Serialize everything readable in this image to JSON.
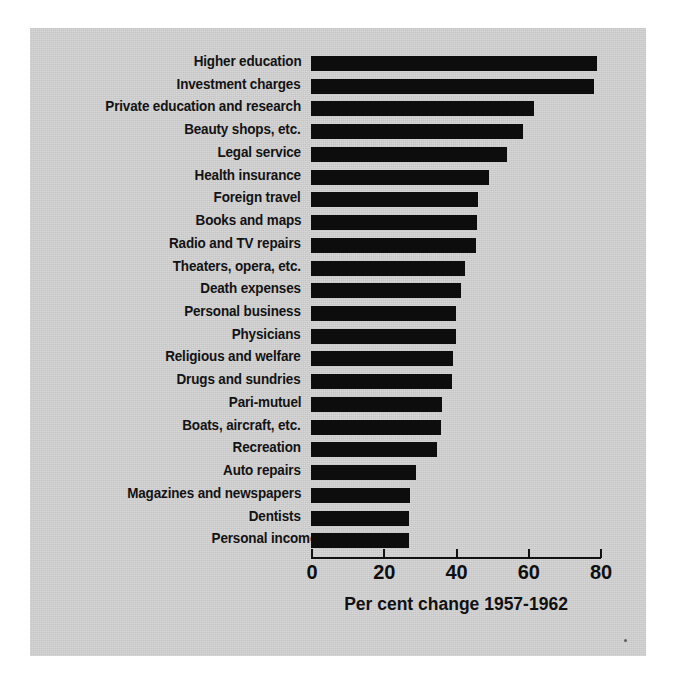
{
  "chart_data": {
    "type": "bar",
    "orientation": "horizontal",
    "title": "",
    "xlabel": "Per cent change 1957-1962",
    "ylabel": "",
    "xlim": [
      0,
      80
    ],
    "xticks": [
      0,
      20,
      40,
      60,
      80
    ],
    "xtick_labels": [
      "0",
      "20",
      "40",
      "60",
      "80"
    ],
    "grid": false,
    "legend": null,
    "bar_color": "#0d0d0d",
    "background_color": "#d2d3d2",
    "categories": [
      "Higher education",
      "Investment charges",
      "Private education and research",
      "Beauty shops, etc.",
      "Legal service",
      "Health insurance",
      "Foreign travel",
      "Books and maps",
      "Radio and TV repairs",
      "Theaters, opera, etc.",
      "Death expenses",
      "Personal business",
      "Physicians",
      "Religious and welfare",
      "Drugs and sundries",
      "Pari-mutuel",
      "Boats, aircraft, etc.",
      "Recreation",
      "Auto repairs",
      "Magazines and newspapers",
      "Dentists",
      "Personal income"
    ],
    "values": [
      79.3,
      78.4,
      61.8,
      58.6,
      54.2,
      49.3,
      46.3,
      46.0,
      45.8,
      42.7,
      41.5,
      40.1,
      40.0,
      39.4,
      38.9,
      36.3,
      36.0,
      34.8,
      29.1,
      27.4,
      27.0,
      27.0
    ],
    "indented_categories": [
      "Personal income"
    ]
  }
}
